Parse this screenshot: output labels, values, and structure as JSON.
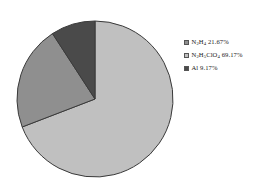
{
  "chart_data": {
    "type": "pie",
    "title": "",
    "subtitle": "",
    "xlabel": "",
    "ylabel": "",
    "legend_position": "right",
    "grid": false,
    "categories": [
      "N2H4",
      "N2H5ClO4",
      "Al"
    ],
    "values": [
      21.67,
      69.17,
      9.17
    ],
    "value_unit": "%",
    "labels": [
      "N2H4 21.67%",
      "N2H5ClO4 69.17%",
      "Al 9.17%"
    ],
    "slices": [
      {
        "name": "N2H4",
        "formula_prefix": "N",
        "formula_sub1": "2",
        "formula_mid": "H",
        "formula_sub2": "4",
        "formula_suffix": "",
        "value": 21.67,
        "label": "N2H4 21.67%",
        "percent_text": " 21.67%",
        "color": "#8f8f8f"
      },
      {
        "name": "N2H5ClO4",
        "formula_prefix": "N",
        "formula_sub1": "2",
        "formula_mid": "H",
        "formula_sub2": "5",
        "formula_suffix": "ClO",
        "formula_sub3": "4",
        "value": 69.17,
        "label": "N2H5ClO4 69.17%",
        "percent_text": " 69.17%",
        "color": "#c0c0c0"
      },
      {
        "name": "Al",
        "formula_prefix": "Al",
        "value": 9.17,
        "label": "Al 9.17%",
        "percent_text": " 9.17%",
        "color": "#4a4a4a"
      }
    ],
    "outline_color": "#3a3a3a",
    "background": "#ffffff"
  },
  "legend": {
    "entries": [
      {
        "label": "N2H4 21.67%",
        "color": "#8f8f8f"
      },
      {
        "label": "N2H5ClO4 69.17%",
        "color": "#c0c0c0"
      },
      {
        "label": "Al 9.17%",
        "color": "#4a4a4a"
      }
    ]
  }
}
